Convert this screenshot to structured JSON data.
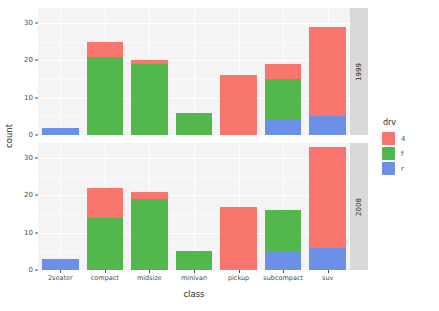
{
  "chart_data": {
    "type": "bar",
    "subtype": "stacked-bar-faceted",
    "title": "",
    "xlabel": "class",
    "ylabel": "count",
    "ylim": [
      0,
      34
    ],
    "yticks": [
      0,
      10,
      20,
      30
    ],
    "ytick_labels": [
      "0",
      "10",
      "20",
      "30"
    ],
    "grid": true,
    "legend": {
      "title": "drv",
      "position": "right",
      "entries": [
        {
          "label": "4",
          "color": "#F8766D"
        },
        {
          "label": "f",
          "color": "#53B84B"
        },
        {
          "label": "r",
          "color": "#6C90E8"
        }
      ]
    },
    "facet_variable": "year",
    "facet_position": "right-strip",
    "categories": [
      "2seater",
      "compact",
      "midsize",
      "minivan",
      "pickup",
      "subcompact",
      "suv"
    ],
    "panels": [
      {
        "facet_label": "1999",
        "series": [
          {
            "name": "r",
            "color": "#6C90E8",
            "values": [
              2,
              0,
              0,
              0,
              0,
              4,
              5
            ]
          },
          {
            "name": "f",
            "color": "#53B84B",
            "values": [
              0,
              21,
              19,
              6,
              0,
              11,
              0
            ]
          },
          {
            "name": "4",
            "color": "#F8766D",
            "values": [
              0,
              4,
              1,
              0,
              16,
              4,
              24
            ]
          }
        ],
        "totals": [
          2,
          25,
          20,
          6,
          16,
          19,
          29
        ]
      },
      {
        "facet_label": "2008",
        "series": [
          {
            "name": "r",
            "color": "#6C90E8",
            "values": [
              3,
              0,
              0,
              0,
              0,
              5,
              6
            ]
          },
          {
            "name": "f",
            "color": "#53B84B",
            "values": [
              0,
              14,
              19,
              5,
              0,
              11,
              0
            ]
          },
          {
            "name": "4",
            "color": "#F8766D",
            "values": [
              0,
              8,
              2,
              0,
              17,
              0,
              27
            ]
          }
        ],
        "totals": [
          3,
          22,
          21,
          5,
          17,
          16,
          33
        ]
      }
    ],
    "colors": {
      "panel_background": "#f4f4f4",
      "strip_background": "#d9d9d9",
      "gridline": "#ffffff",
      "text": "#4d4d4d",
      "plot_background": "#ffffff"
    }
  }
}
